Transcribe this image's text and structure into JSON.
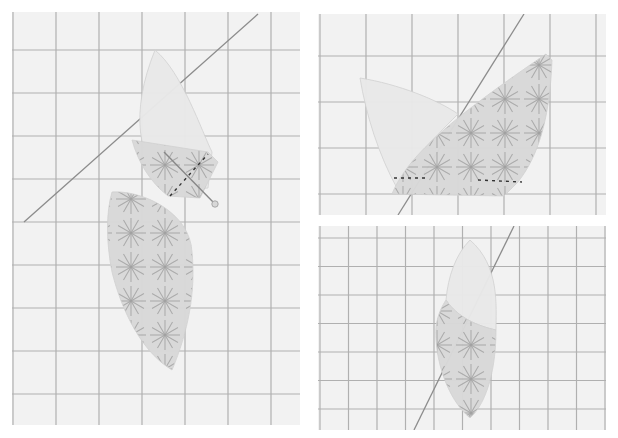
{
  "collage": {
    "background": "#ffffff",
    "mat_color": "#f2f2f2",
    "grid_color": "#9a9a9a",
    "diagonal_color": "#8c8c8c",
    "plain_fabric_color": "#e9e9e9",
    "print_fabric_color": "#d9d9d9",
    "print_stroke_color": "#9d9d9d",
    "stitch_color": "#333333",
    "pin_color": "#888888"
  },
  "panels": [
    {
      "id": "step-1-pinned",
      "box": {
        "x": 12,
        "y": 12,
        "w": 288,
        "h": 413
      },
      "grid": {
        "spacing": 43,
        "offset_x": 1,
        "offset_y": 38
      },
      "diagonal": [
        [
          246,
          2
        ],
        [
          12,
          210
        ]
      ],
      "pieces": [
        {
          "kind": "plain",
          "path": "M143,38 C170,60 190,120 200,140 L196,176 L160,180 C124,150 118,100 143,38 Z"
        },
        {
          "kind": "print",
          "path": "M120,128 L196,140 L206,150 L188,186 L156,184 C138,170 126,150 120,128 Z"
        },
        {
          "kind": "print",
          "path": "M100,180 C130,178 178,200 180,240 C184,280 176,320 160,358 C130,340 110,300 100,260 C94,230 94,200 100,180 Z"
        }
      ],
      "stitches": [
        [
          [
            158,
            184
          ],
          [
            196,
            142
          ]
        ]
      ],
      "pin": {
        "from": [
          152,
          140
        ],
        "to": [
          203,
          192
        ]
      }
    },
    {
      "id": "step-2-opened",
      "box": {
        "x": 318,
        "y": 14,
        "w": 288,
        "h": 201
      },
      "grid": {
        "spacing": 46,
        "offset_x": 2,
        "offset_y": 42
      },
      "diagonal": [
        [
          206,
          0
        ],
        [
          80,
          201
        ]
      ],
      "pieces": [
        {
          "kind": "plain",
          "path": "M42,64 C80,70 120,86 140,100 C110,130 90,150 80,176 C60,140 48,100 42,64 Z"
        },
        {
          "kind": "print",
          "path": "M228,40 L234,46 C232,100 222,140 200,168 L186,182 L74,180 C90,140 140,100 228,40 Z"
        }
      ],
      "stitches": [
        [
          [
            76,
            164
          ],
          [
            110,
            164
          ]
        ],
        [
          [
            160,
            166
          ],
          [
            204,
            168
          ]
        ]
      ],
      "pin": null
    },
    {
      "id": "step-3-finished-petal",
      "box": {
        "x": 318,
        "y": 226,
        "w": 288,
        "h": 204
      },
      "grid": {
        "spacing": 28.5,
        "offset_x": 2,
        "offset_y": 12
      },
      "diagonal": [
        [
          196,
          0
        ],
        [
          96,
          204
        ]
      ],
      "pieces": [
        {
          "kind": "plain",
          "path": "M152,14 C182,40 178,80 178,104 C160,100 140,92 128,74 C130,50 138,28 152,14 Z"
        },
        {
          "kind": "print",
          "path": "M128,74 C140,92 160,100 178,104 C178,140 170,176 152,192 C128,172 116,130 118,100 C120,88 124,80 128,74 Z"
        }
      ],
      "stitches": [],
      "pin": null
    }
  ]
}
